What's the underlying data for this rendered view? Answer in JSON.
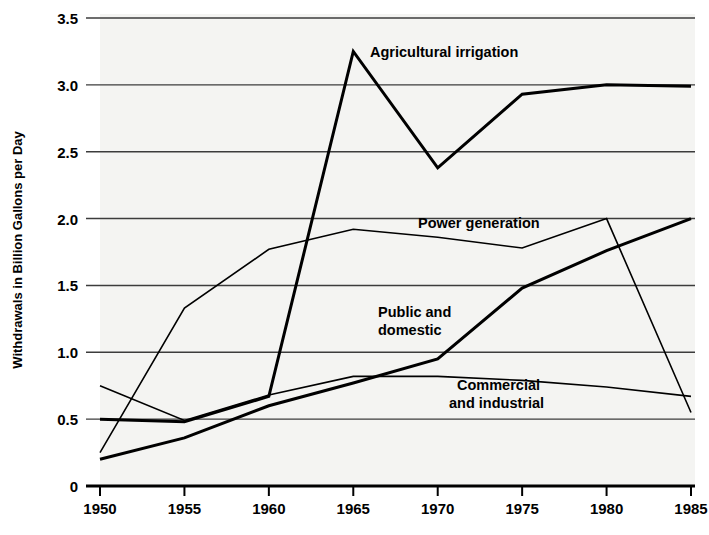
{
  "chart_data": {
    "type": "line",
    "title": "",
    "xlabel": "",
    "ylabel": "Withdrawals in Billion Gallons per Day",
    "x": [
      1950,
      1955,
      1960,
      1965,
      1970,
      1975,
      1980,
      1985
    ],
    "xtick_labels": [
      "1950",
      "1955",
      "1960",
      "1965",
      "1970",
      "1975",
      "1980",
      "1985"
    ],
    "ytick_labels": [
      "0",
      "0.5",
      "1.0",
      "1.5",
      "2.0",
      "2.5",
      "3.0",
      "3.5"
    ],
    "ytick_values": [
      0,
      0.5,
      1.0,
      1.5,
      2.0,
      2.5,
      3.0,
      3.5
    ],
    "xlim": [
      1950,
      1985
    ],
    "ylim": [
      0,
      3.5
    ],
    "grid": "horizontal",
    "legend": "inline-annotations",
    "series": [
      {
        "name": "Agricultural irrigation",
        "label": "Agricultural irrigation",
        "color": "#000000",
        "width": 3.0,
        "values": [
          0.5,
          0.48,
          0.67,
          3.25,
          2.38,
          2.93,
          3.0,
          2.99
        ]
      },
      {
        "name": "Power generation",
        "label": "Power generation",
        "color": "#000000",
        "width": 1.6,
        "values": [
          0.25,
          1.33,
          1.77,
          1.92,
          1.86,
          1.78,
          2.0,
          0.55
        ]
      },
      {
        "name": "Public and domestic",
        "label_line1": "Public and",
        "label_line2": "domestic",
        "label": "Public and domestic",
        "color": "#000000",
        "width": 3.0,
        "values": [
          0.2,
          0.36,
          0.6,
          0.77,
          0.95,
          1.48,
          1.76,
          2.0
        ]
      },
      {
        "name": "Commercial and industrial",
        "label_line1": "Commercial",
        "label_line2": "and industrial",
        "label": "Commercial and industrial",
        "color": "#000000",
        "width": 1.6,
        "values": [
          0.75,
          0.49,
          0.68,
          0.82,
          0.82,
          0.79,
          0.74,
          0.67
        ]
      }
    ],
    "annotations": [
      {
        "text": "Agricultural irrigation",
        "x": 370,
        "y": 57
      },
      {
        "text": "Power generation",
        "x": 418,
        "y": 228
      },
      {
        "text": "Public and",
        "x": 378,
        "y": 317
      },
      {
        "text": "domestic",
        "x": 378,
        "y": 335
      },
      {
        "text": "Commercial",
        "x": 457,
        "y": 390
      },
      {
        "text": "and industrial",
        "x": 449,
        "y": 408
      }
    ]
  }
}
